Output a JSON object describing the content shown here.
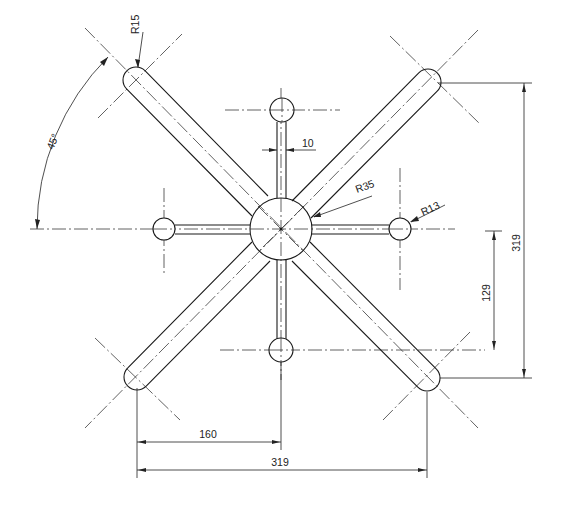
{
  "drawing": {
    "type": "technical-drawing",
    "subject": "star-shaped base / spider with four diagonal arms and four radial spokes",
    "stroke_color": "#1a1a1a",
    "background": "#ffffff"
  },
  "dimensions": {
    "r15": "R15",
    "r35": "R35",
    "r13": "R13",
    "spoke_width": "10",
    "angle": "45°",
    "vertical_overall": "319",
    "vertical_partial": "129",
    "horizontal_half": "160",
    "horizontal_overall": "319"
  }
}
